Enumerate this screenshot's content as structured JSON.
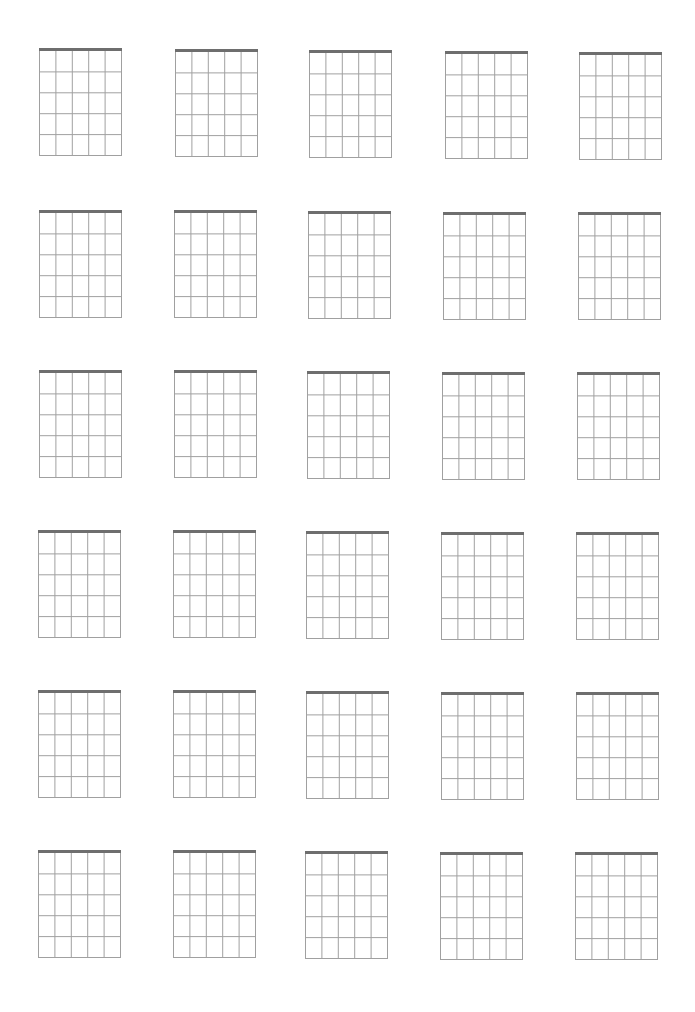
{
  "sheet": {
    "type": "blank-chord-diagram-sheet",
    "columns": 5,
    "rows": 6,
    "strings_per_diagram": 6,
    "frets_per_diagram": 5,
    "colors": {
      "background": "#ffffff",
      "nut": "#6e6e6e",
      "grid": "#a0a0a0"
    },
    "box_size": {
      "width": 83,
      "height": 108
    },
    "boxes": [
      {
        "row": 1,
        "col": 1,
        "x": 39,
        "y": 48
      },
      {
        "row": 1,
        "col": 2,
        "x": 175,
        "y": 49
      },
      {
        "row": 1,
        "col": 3,
        "x": 309,
        "y": 50
      },
      {
        "row": 1,
        "col": 4,
        "x": 445,
        "y": 51
      },
      {
        "row": 1,
        "col": 5,
        "x": 579,
        "y": 52
      },
      {
        "row": 2,
        "col": 1,
        "x": 39,
        "y": 210
      },
      {
        "row": 2,
        "col": 2,
        "x": 174,
        "y": 210
      },
      {
        "row": 2,
        "col": 3,
        "x": 308,
        "y": 211
      },
      {
        "row": 2,
        "col": 4,
        "x": 443,
        "y": 212
      },
      {
        "row": 2,
        "col": 5,
        "x": 578,
        "y": 212
      },
      {
        "row": 3,
        "col": 1,
        "x": 39,
        "y": 370
      },
      {
        "row": 3,
        "col": 2,
        "x": 174,
        "y": 370
      },
      {
        "row": 3,
        "col": 3,
        "x": 307,
        "y": 371
      },
      {
        "row": 3,
        "col": 4,
        "x": 442,
        "y": 372
      },
      {
        "row": 3,
        "col": 5,
        "x": 577,
        "y": 372
      },
      {
        "row": 4,
        "col": 1,
        "x": 38,
        "y": 530
      },
      {
        "row": 4,
        "col": 2,
        "x": 173,
        "y": 530
      },
      {
        "row": 4,
        "col": 3,
        "x": 306,
        "y": 531
      },
      {
        "row": 4,
        "col": 4,
        "x": 441,
        "y": 532
      },
      {
        "row": 4,
        "col": 5,
        "x": 576,
        "y": 532
      },
      {
        "row": 5,
        "col": 1,
        "x": 38,
        "y": 690
      },
      {
        "row": 5,
        "col": 2,
        "x": 173,
        "y": 690
      },
      {
        "row": 5,
        "col": 3,
        "x": 306,
        "y": 691
      },
      {
        "row": 5,
        "col": 4,
        "x": 441,
        "y": 692
      },
      {
        "row": 5,
        "col": 5,
        "x": 576,
        "y": 692
      },
      {
        "row": 6,
        "col": 1,
        "x": 38,
        "y": 850
      },
      {
        "row": 6,
        "col": 2,
        "x": 173,
        "y": 850
      },
      {
        "row": 6,
        "col": 3,
        "x": 305,
        "y": 851
      },
      {
        "row": 6,
        "col": 4,
        "x": 440,
        "y": 852
      },
      {
        "row": 6,
        "col": 5,
        "x": 575,
        "y": 852
      }
    ]
  }
}
